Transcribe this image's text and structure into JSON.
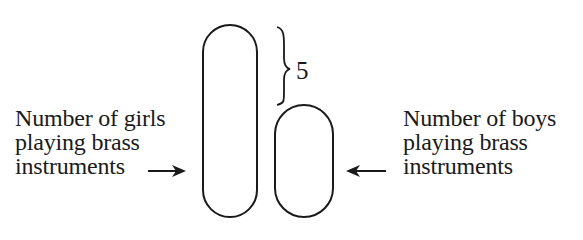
{
  "diagram": {
    "type": "bar-model",
    "girls": {
      "label_lines": [
        "Number of girls",
        "playing brass",
        "instruments"
      ],
      "shape": "tall-oval",
      "arrow_direction": "right"
    },
    "boys": {
      "label_lines": [
        "Number of boys",
        "playing brass",
        "instruments"
      ],
      "shape": "short-oval",
      "arrow_direction": "left"
    },
    "difference": {
      "value": "5",
      "marker": "curly-brace"
    }
  }
}
